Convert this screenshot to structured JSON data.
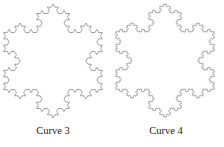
{
  "figures": [
    {
      "caption": "Curve 3",
      "iteration": 3,
      "stroke": "#8a8a8a"
    },
    {
      "caption": "Curve 4",
      "iteration": 4,
      "stroke": "#8a8a8a"
    }
  ]
}
